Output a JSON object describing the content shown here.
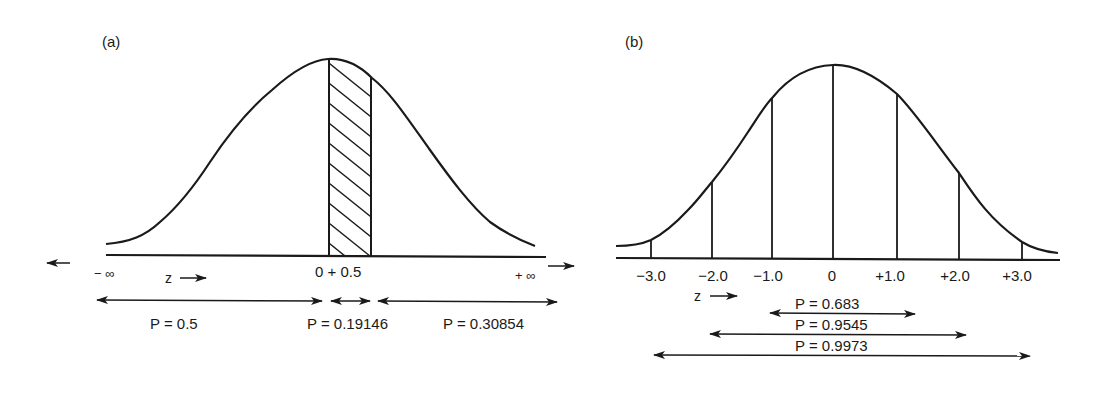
{
  "panel_a": {
    "label": "(a)",
    "x_labels": {
      "neg_inf": "− ∞",
      "pos_inf": "+ ∞",
      "center": "0 + 0.5",
      "z_axis": "z"
    },
    "probabilities": [
      {
        "label": "P = 0.5",
        "range": "-inf to 0"
      },
      {
        "label": "P = 0.19146",
        "range": "0 to 0.5"
      },
      {
        "label": "P = 0.30854",
        "range": "0.5 to +inf"
      }
    ],
    "shaded_region": {
      "from": 0,
      "to": 0.5,
      "style": "diagonal-hatch"
    }
  },
  "panel_b": {
    "label": "(b)",
    "ticks": [
      "−3.0",
      "−2.0",
      "−1.0",
      "0",
      "+1.0",
      "+2.0",
      "+3.0"
    ],
    "z_axis": "z",
    "probabilities": [
      {
        "label": "P = 0.683",
        "range": "-1.0 to +1.0"
      },
      {
        "label": "P = 0.9545",
        "range": "-2.0 to +2.0"
      },
      {
        "label": "P = 0.9973",
        "range": "-3.0 to +3.0"
      }
    ]
  },
  "colors": {
    "ink": "#1a1a1a",
    "background": "#ffffff"
  }
}
